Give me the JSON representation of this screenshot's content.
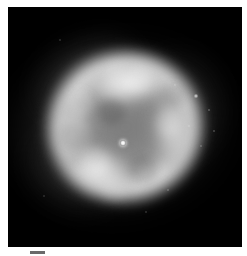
{
  "page": {
    "background_color": "#ffffff",
    "width": 247,
    "height": 256
  },
  "image_panel": {
    "name": "astronomical-image",
    "subject": "planetary nebula",
    "background_color": "#000000",
    "frame": {
      "x": 8,
      "y": 7,
      "width": 234,
      "height": 240
    }
  },
  "nebula": {
    "morphology": "elliptical ring / shell with bright rim and fainter interior cavity",
    "position_angle_deg": -10,
    "shell": {
      "center_x_pct": 50,
      "center_y_pct": 50,
      "width_pct": 72,
      "height_pct": 68,
      "rim_color": "#e4e4e4",
      "interior_color": "#808080"
    },
    "halo": {
      "description": "faint diffuse outer emission with wispy filaments",
      "color": "#747474"
    },
    "bright_arcs": [
      {
        "name": "rim-top",
        "brightness": "brightest",
        "color": "#f8f8f8"
      },
      {
        "name": "rim-lower-left",
        "brightness": "bright",
        "color": "#eeeeee"
      },
      {
        "name": "rim-right",
        "brightness": "moderate",
        "color": "#e0e0e0"
      },
      {
        "name": "rim-left",
        "brightness": "moderate",
        "color": "#d8d8d8"
      }
    ]
  },
  "central_star": {
    "label": "central star",
    "x": 115,
    "y": 136,
    "color": "#ffffff"
  },
  "field_stars": [
    {
      "x": 196,
      "y": 96,
      "size": 1.6,
      "opacity": 0.8
    },
    {
      "x": 209,
      "y": 110,
      "size": 1.3,
      "opacity": 0.62
    },
    {
      "x": 214,
      "y": 131,
      "size": 1.2,
      "opacity": 0.55
    },
    {
      "x": 201,
      "y": 146,
      "size": 1.1,
      "opacity": 0.48
    },
    {
      "x": 189,
      "y": 126,
      "size": 1.0,
      "opacity": 0.42
    },
    {
      "x": 175,
      "y": 85,
      "size": 1.1,
      "opacity": 0.45
    },
    {
      "x": 168,
      "y": 190,
      "size": 1.2,
      "opacity": 0.5
    },
    {
      "x": 60,
      "y": 40,
      "size": 1.0,
      "opacity": 0.38
    },
    {
      "x": 44,
      "y": 196,
      "size": 1.0,
      "opacity": 0.36
    },
    {
      "x": 146,
      "y": 212,
      "size": 1.1,
      "opacity": 0.4
    }
  ],
  "caption": {
    "scale_bar_label": "",
    "text": ""
  }
}
